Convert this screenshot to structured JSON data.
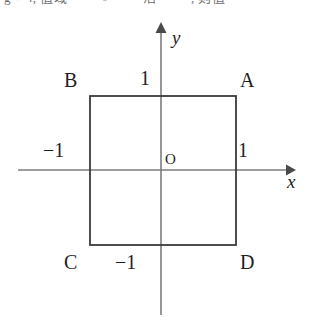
{
  "page": {
    "background_color": "#ffffff",
    "width": 315,
    "height": 320
  },
  "clipped_header": {
    "text": "g  + 4,  值域  ——  ○  ——  活  —— , 则值"
  },
  "figure": {
    "caption_type": "coordinate-plane-with-square",
    "colors": {
      "axis": "#7d7d7d",
      "square": "#3a3a3a",
      "text": "#1f1f1f"
    },
    "axes": {
      "x_label": "x",
      "y_label": "y",
      "origin_label": "O"
    },
    "ticks": {
      "top": "1",
      "right": "1",
      "left": "−1",
      "bottom": "−1"
    },
    "vertices": {
      "top_right": "A",
      "top_left": "B",
      "bottom_left": "C",
      "bottom_right": "D"
    },
    "geometry": {
      "square_left_x": -1,
      "square_right_x": 1,
      "square_top_y": 1,
      "square_bottom_y": -1
    }
  }
}
